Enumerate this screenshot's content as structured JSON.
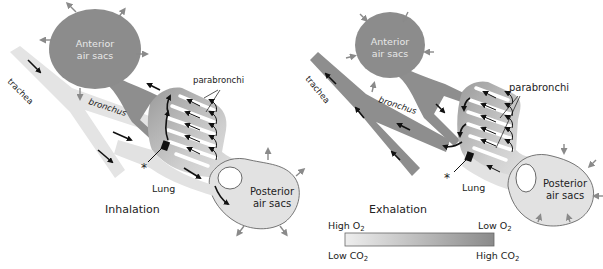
{
  "panels": [
    {
      "id": "inhalation",
      "title": "Inhalation",
      "labels": {
        "anterior_line1": "Anterior",
        "anterior_line2": "air sacs",
        "trachea": "trachea",
        "bronchus": "bronchus",
        "parabronchi": "parabronchi",
        "lung": "Lung",
        "posterior_line1": "Posterior",
        "posterior_line2": "air sacs",
        "asterisk": "*"
      },
      "colors": {
        "anterior_sac": "#8c8c8c",
        "trachea": "#e4e4e4",
        "posterior_sac": "#e2e2e2"
      }
    },
    {
      "id": "exhalation",
      "title": "Exhalation",
      "labels": {
        "anterior_line1": "Anterior",
        "anterior_line2": "air sacs",
        "trachea": "trachea",
        "bronchus": "bronchus",
        "parabronchi": "parabronchi",
        "lung": "Lung",
        "posterior_line1": "Posterior",
        "posterior_line2": "air sacs",
        "asterisk": "*"
      },
      "colors": {
        "anterior_sac": "#8c8c8c",
        "trachea": "#8e8e8e",
        "posterior_sac": "#e2e2e2"
      }
    }
  ],
  "legend": {
    "top_left": "High O",
    "top_left_sub": "2",
    "top_right": "Low O",
    "top_right_sub": "2",
    "bottom_left": "Low CO",
    "bottom_left_sub": "2",
    "bottom_right": "High CO",
    "bottom_right_sub": "2",
    "gradient_start": "#eeeeee",
    "gradient_end": "#8a8a8a"
  }
}
